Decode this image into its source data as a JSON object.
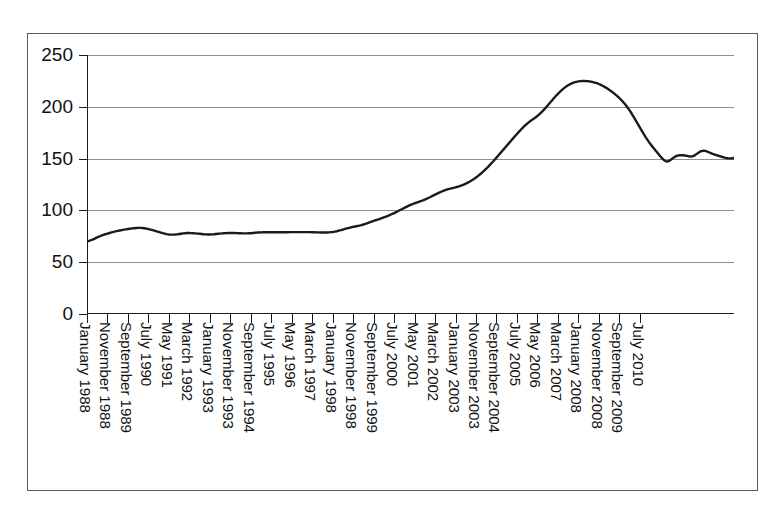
{
  "chart_data": {
    "type": "line",
    "title": "",
    "xlabel": "",
    "ylabel": "",
    "ylim": [
      0,
      250
    ],
    "ytick_values": [
      0,
      50,
      100,
      150,
      200,
      250
    ],
    "ytick_labels": [
      "0",
      "50",
      "100",
      "150",
      "200",
      "250"
    ],
    "grid": "horizontal",
    "legend": "none",
    "line_color": "#1a1a1a",
    "line_width": 2.4,
    "x_start": "January 1988",
    "x_end": "July 2011",
    "x_interval_months": 1,
    "xtick_interval_months": 10,
    "xtick_labels": [
      "January 1988",
      "November 1988",
      "September 1989",
      "July 1990",
      "May 1991",
      "March 1992",
      "January 1993",
      "November 1993",
      "September 1994",
      "July 1995",
      "May 1996",
      "March 1997",
      "January 1998",
      "November 1998",
      "September 1999",
      "July 2000",
      "May 2001",
      "March 2002",
      "January 2003",
      "November 2003",
      "September 2004",
      "July 2005",
      "May 2006",
      "March 2007",
      "January 2008",
      "November 2008",
      "September 2009",
      "July 2010"
    ],
    "series": [
      {
        "name": "index",
        "values": [
          70.0,
          70.6,
          71.3,
          72.1,
          73.0,
          73.9,
          74.8,
          75.6,
          76.3,
          77.0,
          77.6,
          78.2,
          78.8,
          79.3,
          79.8,
          80.2,
          80.6,
          81.0,
          81.4,
          81.7,
          82.0,
          82.3,
          82.6,
          82.8,
          83.0,
          83.1,
          83.1,
          83.0,
          82.8,
          82.4,
          82.0,
          81.5,
          81.0,
          80.4,
          79.8,
          79.2,
          78.6,
          78.0,
          77.5,
          77.1,
          76.8,
          76.6,
          76.6,
          76.7,
          76.9,
          77.2,
          77.5,
          77.8,
          78.0,
          78.2,
          78.2,
          78.1,
          78.0,
          77.8,
          77.6,
          77.4,
          77.2,
          77.0,
          76.9,
          76.8,
          76.8,
          76.9,
          77.0,
          77.2,
          77.4,
          77.6,
          77.8,
          78.0,
          78.1,
          78.2,
          78.2,
          78.2,
          78.2,
          78.1,
          78.0,
          77.9,
          77.8,
          77.8,
          77.8,
          77.9,
          78.0,
          78.2,
          78.4,
          78.6,
          78.7,
          78.8,
          78.9,
          78.9,
          78.9,
          78.9,
          78.9,
          78.9,
          78.9,
          78.9,
          78.9,
          78.9,
          78.9,
          78.9,
          78.9,
          79.0,
          79.0,
          79.0,
          79.0,
          79.0,
          79.0,
          79.0,
          79.0,
          79.0,
          79.0,
          79.0,
          78.9,
          78.9,
          78.8,
          78.8,
          78.7,
          78.7,
          78.7,
          78.7,
          78.8,
          79.0,
          79.2,
          79.5,
          79.9,
          80.4,
          80.9,
          81.5,
          82.1,
          82.7,
          83.2,
          83.7,
          84.1,
          84.5,
          84.9,
          85.3,
          85.8,
          86.4,
          87.0,
          87.7,
          88.4,
          89.1,
          89.8,
          90.5,
          91.2,
          91.9,
          92.6,
          93.3,
          94.0,
          94.8,
          95.6,
          96.5,
          97.4,
          98.4,
          99.4,
          100.4,
          101.4,
          102.4,
          103.4,
          104.4,
          105.3,
          106.1,
          106.9,
          107.6,
          108.3,
          109.0,
          109.7,
          110.5,
          111.3,
          112.2,
          113.2,
          114.2,
          115.2,
          116.2,
          117.1,
          118.0,
          118.8,
          119.5,
          120.2,
          120.8,
          121.3,
          121.8,
          122.3,
          122.8,
          123.4,
          124.1,
          124.9,
          125.8,
          126.8,
          127.9,
          129.1,
          130.4,
          131.8,
          133.3,
          134.9,
          136.6,
          138.4,
          140.3,
          142.3,
          144.4,
          146.5,
          148.7,
          150.9,
          153.2,
          155.5,
          157.8,
          160.1,
          162.4,
          164.7,
          167.0,
          169.3,
          171.6,
          173.8,
          176.0,
          178.1,
          180.1,
          182.0,
          183.8,
          185.4,
          186.9,
          188.3,
          189.7,
          191.2,
          192.9,
          194.8,
          196.8,
          199.0,
          201.3,
          203.6,
          205.9,
          208.2,
          210.4,
          212.5,
          214.5,
          216.3,
          218.0,
          219.5,
          220.8,
          221.9,
          222.8,
          223.5,
          224.1,
          224.5,
          224.8,
          224.9,
          224.9,
          224.8,
          224.6,
          224.3,
          223.9,
          223.4,
          222.8,
          222.0,
          221.1,
          220.1,
          219.0,
          217.8,
          216.5,
          215.1,
          213.6,
          212.0,
          210.3,
          208.5,
          206.5,
          204.3,
          201.9,
          199.3,
          196.5,
          193.5,
          190.3,
          187.0,
          183.6,
          180.2,
          176.8,
          173.5,
          170.3,
          167.3,
          164.5,
          161.9,
          159.4,
          157.0,
          154.6,
          152.2,
          150.0,
          148.2,
          147.2,
          147.4,
          148.6,
          150.2,
          151.6,
          152.6,
          153.2,
          153.4,
          153.3,
          153.0,
          152.6,
          152.2,
          152.0,
          152.4,
          153.4,
          154.8,
          156.2,
          157.2,
          157.6,
          157.4,
          156.8,
          155.9,
          155.0,
          154.2,
          153.6,
          153.0,
          152.4,
          151.8,
          151.2,
          150.7,
          150.4,
          150.2,
          150.3,
          150.6
        ]
      }
    ]
  }
}
